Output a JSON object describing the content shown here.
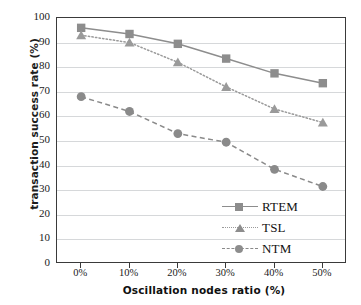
{
  "chart_data": {
    "type": "line",
    "title": "",
    "xlabel": "Oscillation nodes ratio (%)",
    "ylabel": "transaction success rate (%)",
    "categories": [
      "0%",
      "10%",
      "20%",
      "30%",
      "40%",
      "50%"
    ],
    "x": [
      0,
      10,
      20,
      30,
      40,
      50
    ],
    "ylim": [
      0,
      100
    ],
    "ytick_values": [
      0,
      10,
      20,
      30,
      40,
      50,
      60,
      70,
      80,
      90,
      100
    ],
    "ytick_labels": [
      "0",
      "10",
      "20",
      "30",
      "40",
      "50",
      "60",
      "70",
      "80",
      "90",
      "100"
    ],
    "grid": true,
    "grid_axis": "y",
    "legend_position": "lower-right-inside",
    "series": [
      {
        "name": "RTEM",
        "values": [
          96,
          93.5,
          89.5,
          83.5,
          77.5,
          73.5
        ],
        "line_style": "solid",
        "marker": "square",
        "color": "#8d8d8d"
      },
      {
        "name": "TSL",
        "values": [
          93,
          90,
          82,
          72,
          63,
          57.5
        ],
        "line_style": "dotted",
        "marker": "triangle",
        "color": "#9a9a9a"
      },
      {
        "name": "NTM",
        "values": [
          68,
          62,
          53,
          49.5,
          38.5,
          31.5
        ],
        "line_style": "dashed",
        "marker": "circle",
        "color": "#8a8a8a"
      }
    ]
  },
  "axes": {
    "y_title": "transaction success rate (%)",
    "x_title": "Oscillation nodes ratio (%)"
  },
  "legend": {
    "items": [
      {
        "label": "RTEM",
        "marker": "square-marker",
        "dash": "solid"
      },
      {
        "label": "TSL",
        "marker": "triangle-marker",
        "dash": "dotted"
      },
      {
        "label": "NTM",
        "marker": "circle-marker",
        "dash": "dashed"
      }
    ]
  },
  "colors": {
    "series_gray": "#8d8d8d",
    "frame": "#3a3a3a",
    "grid": "#d6d8da",
    "text": "#1a1a1a",
    "background": "#ffffff"
  }
}
